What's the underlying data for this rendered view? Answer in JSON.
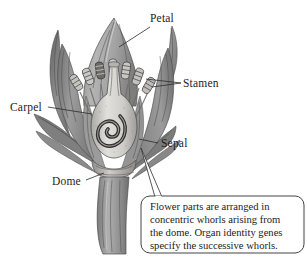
{
  "figure": {
    "type": "botanical-illustration",
    "style": "grayscale-pencil-shaded",
    "background_color": "#ffffff"
  },
  "labels": [
    {
      "id": "petal",
      "text": "Petal",
      "x": 150,
      "y": 22,
      "anchor": "start"
    },
    {
      "id": "stamen",
      "text": "Stamen",
      "x": 183,
      "y": 86,
      "anchor": "start"
    },
    {
      "id": "carpel",
      "text": "Carpel",
      "x": 10,
      "y": 110,
      "anchor": "start"
    },
    {
      "id": "sepal",
      "text": "Sepal",
      "x": 160,
      "y": 146,
      "anchor": "start"
    },
    {
      "id": "dome",
      "text": "Dome",
      "x": 52,
      "y": 184,
      "anchor": "start"
    }
  ],
  "callout": {
    "lines": [
      "Flower parts are arranged in",
      "concentric whorls arising from",
      "the dome. Organ identity genes",
      "specify the successive whorls."
    ],
    "border_color": "#3a3a3a",
    "fill_color": "#ffffff"
  },
  "colors": {
    "ink": "#1c1c1c",
    "leader_line": "#2b2b2b",
    "petal_light": "#b9b9b9",
    "petal_mid": "#9a9a9a",
    "petal_dark": "#7b7b7b",
    "sepal_dark": "#6e6e6e",
    "carpel_light": "#d8d6d2",
    "stem": "#8e8e8e",
    "outline": "#4a4a4a"
  },
  "parts": [
    {
      "name": "petal",
      "whorl": 2,
      "description": "broad pointed central petal and flanking petals"
    },
    {
      "name": "stamen",
      "whorl": 3,
      "description": "ring of filaments topped by striped anthers"
    },
    {
      "name": "carpel",
      "whorl": 4,
      "description": "central flask-shaped carpel with spiral ovule"
    },
    {
      "name": "sepal",
      "whorl": 1,
      "description": "outer narrow curved sepals splayed downward"
    },
    {
      "name": "dome",
      "whorl": 0,
      "description": "receptacle dome at the base of the whorls"
    }
  ]
}
